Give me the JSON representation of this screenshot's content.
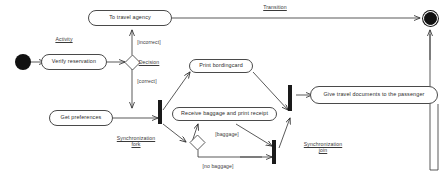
{
  "diagram": {
    "colors": {
      "stroke": "#4a4a4a",
      "fill": "#ffffff",
      "text": "#2b2b2b",
      "solid": "#111111"
    },
    "nodes": {
      "to_travel_agency": "To travel agency",
      "verify_reservation": "Verify  reservation",
      "get_preferences": "Get preferences",
      "print_boardingcard": "Print bordingcard",
      "receive_baggage": "Receive baggage and print receipt",
      "give_documents": "Give travel documents to the passenger"
    },
    "annotations": {
      "activity": "Activity",
      "decision": "Decision",
      "transition": "Transition",
      "sync_fork_line1": "Synchronization",
      "sync_fork_line2": "fork",
      "sync_join_line1": "Synchronization",
      "sync_join_line2": "join"
    },
    "guards": {
      "incorrect": "[incorrect]",
      "correct": "[correct]",
      "baggage": "[baggage]",
      "no_baggage": "[no baggage]"
    },
    "markers": {
      "initial": "initial-node",
      "final": "final-node",
      "decision_1": "decision-diamond",
      "decision_2": "decision-diamond",
      "fork_bar": "synchronization-bar",
      "join_bar_lower": "synchronization-bar",
      "join_bar_upper": "synchronization-bar"
    }
  }
}
